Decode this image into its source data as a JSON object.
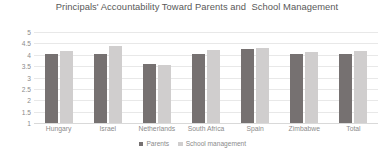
{
  "chart_data": {
    "type": "bar",
    "title": "Principals' Accountability Toward Parents and  School Management",
    "xlabel": "",
    "ylabel": "",
    "ylim": [
      1,
      5
    ],
    "yticks": [
      1,
      1.5,
      2,
      2.5,
      3,
      3.5,
      4,
      4.5,
      5
    ],
    "ytick_labels": [
      "1",
      "1.5",
      "2",
      "2.5",
      "3",
      "3.5",
      "4",
      "4.5",
      "5"
    ],
    "grid": true,
    "legend_position": "bottom",
    "categories": [
      "Hungary",
      "Israel",
      "Netherlands",
      "South Africa",
      "Spain",
      "Zimbabwe",
      "Total"
    ],
    "series": [
      {
        "name": "Parents",
        "color": "#767171",
        "values": [
          4.05,
          4.05,
          3.6,
          4.05,
          4.25,
          4.05,
          4.05
        ]
      },
      {
        "name": "School management",
        "color": "#d0cece",
        "values": [
          4.15,
          4.4,
          3.55,
          4.2,
          4.3,
          4.1,
          4.15
        ]
      }
    ]
  },
  "colors": {
    "parents": "#767171",
    "school_management": "#d0cece",
    "gridline": "#e8e8e8",
    "text": "#8b8b8b",
    "title_text": "#595959",
    "background": "#ffffff"
  }
}
